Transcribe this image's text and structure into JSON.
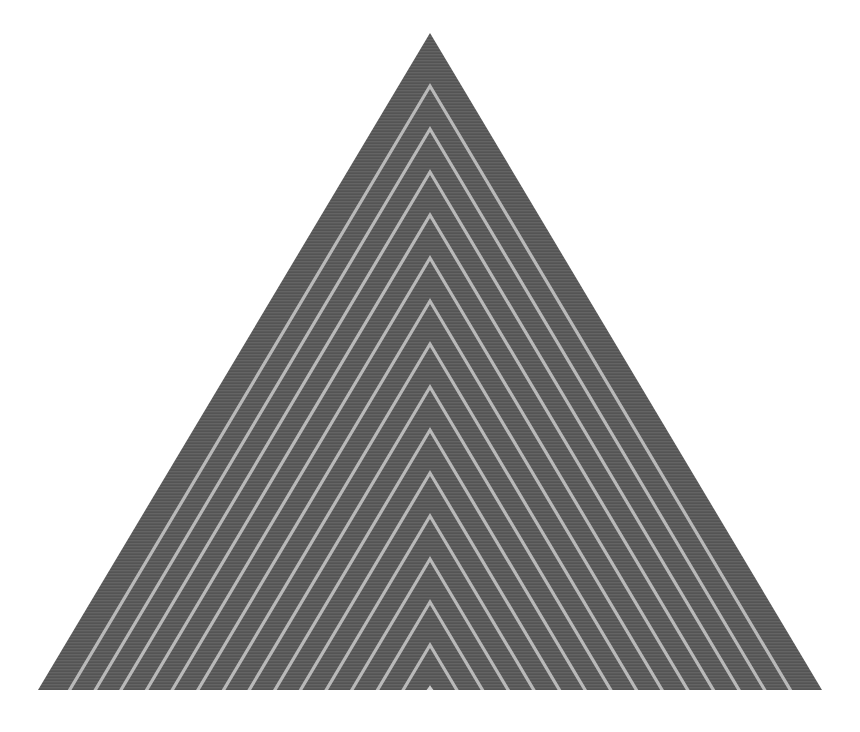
{
  "artwork": {
    "title": "Nested Chevron Triangle",
    "kind": "geometric-abstract-figure",
    "canvas": {
      "width": 860,
      "height": 732,
      "background_color": "#ffffff"
    },
    "triangle": {
      "shape": "isosceles-triangle",
      "apex_x": 430,
      "apex_y": 33,
      "base_left_x": 38,
      "base_right_x": 822,
      "base_y": 690,
      "fill_color": "#5a5a5a",
      "fill_color_secondary": "#606060",
      "texture": "fine-horizontal-striation",
      "texture_line_color": "#646464",
      "texture_line_spacing": 3
    },
    "chevrons": {
      "count": 15,
      "stroke_color": "#b9b9b9",
      "stroke_width": 3.2,
      "spacing_y": 43,
      "first_apex_y": 86,
      "innermost_apex_y": 645,
      "description": "Evenly spaced inverted-V lines nested inside the triangle, parallel to the two slanted edges, apexes descending along the vertical center axis.",
      "apex_y_values": [
        86,
        129,
        172,
        215,
        258,
        301,
        344,
        387,
        430,
        473,
        516,
        559,
        602,
        645,
        688
      ]
    },
    "notch": {
      "present": true,
      "center_x": 430,
      "y": 686,
      "width": 7,
      "height": 6,
      "color": "#cfcfcf",
      "description": "Small light notch where the innermost chevron apex meets the base line."
    }
  }
}
